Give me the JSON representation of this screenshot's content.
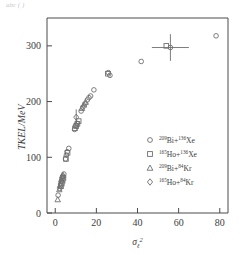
{
  "figure": {
    "top_cut_text": "abc (  )",
    "frame": {
      "left": 47,
      "right": 228,
      "top": 18,
      "bottom": 213
    }
  },
  "chart_data": {
    "type": "scatter",
    "title": "",
    "xlabel": "σℓ²",
    "ylabel": "TKEL/MeV",
    "xlim": [
      -4,
      84
    ],
    "ylim": [
      0,
      350
    ],
    "xticks": [
      0,
      20,
      40,
      60,
      80
    ],
    "yticks": [
      0,
      100,
      200,
      300
    ],
    "grid": false,
    "legend_position": "center-right",
    "series": [
      {
        "name": "²⁰⁹Bi+¹³⁶Xe",
        "marker": "circle",
        "points": [
          [
            1.4,
            32
          ],
          [
            2.2,
            44
          ],
          [
            2.6,
            52
          ],
          [
            3.0,
            57
          ],
          [
            3.3,
            62
          ],
          [
            3.6,
            66
          ],
          [
            4.2,
            70
          ],
          [
            5.0,
            97
          ],
          [
            5.4,
            104
          ],
          [
            5.8,
            110
          ],
          [
            6.6,
            116
          ],
          [
            9.4,
            150
          ],
          [
            10.0,
            157
          ],
          [
            10.6,
            161
          ],
          [
            12.6,
            183
          ],
          [
            13.4,
            190
          ],
          [
            14.4,
            196
          ],
          [
            15.6,
            203
          ],
          [
            16.4,
            207
          ],
          [
            17.2,
            210
          ],
          [
            18.8,
            221
          ],
          [
            25.8,
            252
          ],
          [
            26.6,
            247
          ],
          [
            41.8,
            272
          ],
          [
            56.0,
            297
          ],
          [
            78.2,
            318
          ]
        ]
      },
      {
        "name": "¹⁶⁵Ho+¹³⁶Xe",
        "marker": "square",
        "points": [
          [
            2.8,
            48
          ],
          [
            3.2,
            53
          ],
          [
            3.6,
            58
          ],
          [
            4.0,
            63
          ],
          [
            5.2,
            97
          ],
          [
            6.0,
            108
          ],
          [
            9.6,
            152
          ],
          [
            10.2,
            156
          ],
          [
            10.8,
            160
          ],
          [
            11.4,
            165
          ],
          [
            25.6,
            250
          ],
          [
            54.0,
            300
          ]
        ]
      },
      {
        "name": "²⁰⁹Bi+⁸⁴Kr",
        "marker": "triangle",
        "points": [
          [
            1.2,
            24
          ],
          [
            2.0,
            42
          ],
          [
            2.4,
            50
          ],
          [
            3.0,
            60
          ],
          [
            3.8,
            68
          ],
          [
            13.0,
            188
          ],
          [
            14.0,
            194
          ],
          [
            14.8,
            199
          ]
        ]
      },
      {
        "name": "¹⁶⁵Ho+⁸⁴Kr",
        "marker": "diamond",
        "points": [
          [
            3.4,
            64
          ],
          [
            10.2,
            172
          ]
        ]
      }
    ],
    "error_bars": [
      {
        "x": 10.2,
        "y": 172,
        "xerr": 0.0,
        "yerr": 14,
        "marker": "diamond"
      },
      {
        "x": 56.0,
        "y": 297,
        "xerr": 9.0,
        "yerr": 24,
        "marker": "circle"
      }
    ]
  },
  "legend": {
    "entries": [
      {
        "marker": "circle",
        "label_pre": "209",
        "label_mid": "Bi+",
        "label_sup": "136",
        "label_end": "Xe"
      },
      {
        "marker": "square",
        "label_pre": "165",
        "label_mid": "Ho+",
        "label_sup": "136",
        "label_end": "Xe"
      },
      {
        "marker": "triangle",
        "label_pre": "209",
        "label_mid": "Bi+",
        "label_sup": "84",
        "label_end": "Kr"
      },
      {
        "marker": "diamond",
        "label_pre": "165",
        "label_mid": "Ho+",
        "label_sup": "84",
        "label_end": "Kr"
      }
    ]
  }
}
